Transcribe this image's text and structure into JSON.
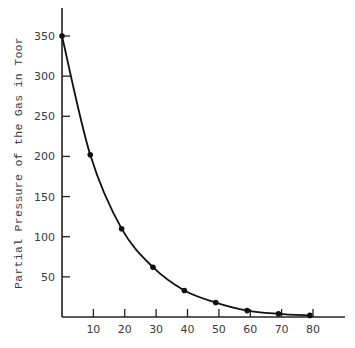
{
  "chart_data": {
    "type": "line",
    "title": "",
    "xlabel": "",
    "ylabel": "Partial Pressure of the Gas in Toor",
    "x": [
      0,
      9,
      19,
      29,
      39,
      49,
      59,
      69,
      79
    ],
    "series": [
      {
        "name": "Partial Pressure",
        "values": [
          350,
          202,
          110,
          62,
          33,
          18,
          8,
          4,
          2
        ]
      }
    ],
    "x_ticks": [
      10,
      20,
      30,
      40,
      50,
      60,
      70,
      80
    ],
    "y_ticks": [
      50,
      100,
      150,
      200,
      250,
      300,
      350
    ],
    "xlim": [
      0,
      90
    ],
    "ylim": [
      0,
      385
    ],
    "grid": false,
    "legend": "none",
    "colors": {
      "line": "#111111",
      "axis": "#222222",
      "text": "#3a3a3a"
    }
  }
}
